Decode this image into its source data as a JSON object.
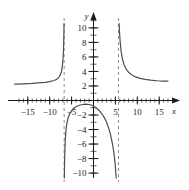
{
  "chart_data": {
    "type": "line",
    "title": "",
    "xlabel": "x",
    "ylabel": "y",
    "xlim": [
      -18,
      17
    ],
    "ylim": [
      -12,
      11
    ],
    "grid": false,
    "legend": null,
    "x_ticks": [
      -15,
      -10,
      -5,
      5,
      10,
      15
    ],
    "x_tick_labels": [
      "-15",
      "-10",
      "-5",
      "5",
      "10",
      "15"
    ],
    "y_ticks": [
      2,
      4,
      6,
      8,
      10,
      -2,
      -4,
      -6,
      -8,
      -10
    ],
    "y_tick_labels": [
      "10",
      "8",
      "6",
      "4",
      "2",
      "-2",
      "-4",
      "-6",
      "-8",
      "-10"
    ],
    "x_minor_tick_step": 1,
    "y_minor_tick_step": 1,
    "asymptotes": {
      "vertical": [
        -6.7,
        5.7
      ],
      "vertical_style": "dashed",
      "horizontal": [
        2
      ],
      "horizontal_style": "implied"
    },
    "branches": [
      {
        "name": "left-branch",
        "description": "approaches y=2 from above as x decreases; rises steeply to +infinity at x=-6.7",
        "points": [
          [
            -18.0,
            2.25
          ],
          [
            -16.0,
            2.3
          ],
          [
            -14.0,
            2.35
          ],
          [
            -12.0,
            2.45
          ],
          [
            -11.0,
            2.5
          ],
          [
            -10.0,
            2.6
          ],
          [
            -9.0,
            2.75
          ],
          [
            -8.5,
            2.9
          ],
          [
            -8.0,
            3.1
          ],
          [
            -7.6,
            3.5
          ],
          [
            -7.3,
            4.0
          ],
          [
            -7.1,
            4.8
          ],
          [
            -6.95,
            5.8
          ],
          [
            -6.85,
            7.0
          ],
          [
            -6.78,
            8.5
          ],
          [
            -6.74,
            10.0
          ],
          [
            -6.72,
            10.6
          ]
        ]
      },
      {
        "name": "middle-branch",
        "description": "from -infinity at x=-6.7, arches up to a local maximum near y=-0.5 around x=-2, then falls to -infinity at x=5.7",
        "points": [
          [
            -6.66,
            -10.8
          ],
          [
            -6.62,
            -9.0
          ],
          [
            -6.55,
            -7.0
          ],
          [
            -6.45,
            -5.5
          ],
          [
            -6.3,
            -4.2
          ],
          [
            -6.1,
            -3.2
          ],
          [
            -5.8,
            -2.4
          ],
          [
            -5.4,
            -1.8
          ],
          [
            -5.0,
            -1.4
          ],
          [
            -4.4,
            -1.0
          ],
          [
            -3.8,
            -0.8
          ],
          [
            -3.2,
            -0.65
          ],
          [
            -2.5,
            -0.55
          ],
          [
            -1.8,
            -0.5
          ],
          [
            -1.0,
            -0.55
          ],
          [
            -0.4,
            -0.65
          ],
          [
            0.2,
            -0.85
          ],
          [
            0.8,
            -1.1
          ],
          [
            1.4,
            -1.45
          ],
          [
            2.0,
            -1.9
          ],
          [
            2.5,
            -2.4
          ],
          [
            3.0,
            -3.0
          ],
          [
            3.4,
            -3.7
          ],
          [
            3.8,
            -4.5
          ],
          [
            4.1,
            -5.3
          ],
          [
            4.4,
            -6.2
          ],
          [
            4.65,
            -7.2
          ],
          [
            4.85,
            -8.2
          ],
          [
            5.0,
            -9.2
          ],
          [
            5.12,
            -10.2
          ],
          [
            5.2,
            -11.0
          ]
        ]
      },
      {
        "name": "right-branch",
        "description": "descends from +infinity at x=5.7, decaying toward the horizontal asymptote y=2",
        "points": [
          [
            5.85,
            10.6
          ],
          [
            5.95,
            9.3
          ],
          [
            6.1,
            8.0
          ],
          [
            6.3,
            6.8
          ],
          [
            6.6,
            5.7
          ],
          [
            7.0,
            4.9
          ],
          [
            7.5,
            4.3
          ],
          [
            8.0,
            3.9
          ],
          [
            8.8,
            3.5
          ],
          [
            9.6,
            3.25
          ],
          [
            10.6,
            3.05
          ],
          [
            11.8,
            2.9
          ],
          [
            13.0,
            2.8
          ],
          [
            14.5,
            2.72
          ],
          [
            16.0,
            2.68
          ],
          [
            17.0,
            2.66
          ]
        ]
      }
    ],
    "curve_color": "#4d4d4d",
    "axis_color": "#1a1a1a",
    "asymptote_color": "#8c8c8c"
  }
}
